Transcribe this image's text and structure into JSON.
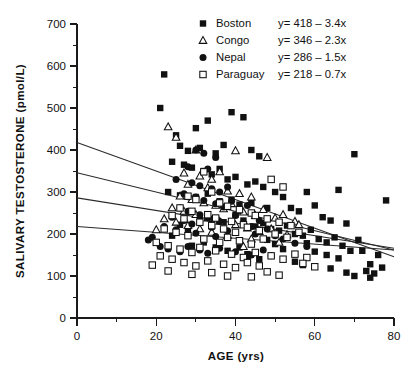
{
  "figure": {
    "background": "#ffffff",
    "ink_color": "#111111"
  },
  "chart_data": {
    "type": "scatter",
    "title": "",
    "xlabel": "AGE (yrs)",
    "ylabel": "SALIVARY TESTOSTERONE (pmol/L)",
    "xlim": [
      0,
      80
    ],
    "ylim": [
      0,
      700
    ],
    "xticks": [
      0,
      20,
      40,
      60,
      80
    ],
    "xtick_labels": [
      "0",
      "20",
      "40",
      "60",
      "80"
    ],
    "xminor_step": 10,
    "yticks": [
      0,
      100,
      200,
      300,
      400,
      500,
      600,
      700
    ],
    "ytick_labels": [
      "0",
      "100",
      "200",
      "300",
      "400",
      "500",
      "600",
      "700"
    ],
    "yminor_step": 50,
    "grid": false,
    "legend_position": "top-right",
    "series": [
      {
        "name": "Boston",
        "marker": "filled-square",
        "equation": "y= 418 – 3.4x",
        "fit": {
          "intercept": 418,
          "slope": -3.4,
          "x_start": 0,
          "x_end": 80
        },
        "points": [
          [
            22,
            580
          ],
          [
            21,
            500
          ],
          [
            25,
            435
          ],
          [
            30,
            452
          ],
          [
            33,
            470
          ],
          [
            39,
            490
          ],
          [
            42,
            478
          ],
          [
            26,
            410
          ],
          [
            28,
            398
          ],
          [
            31,
            405
          ],
          [
            35,
            392
          ],
          [
            37,
            412
          ],
          [
            44,
            400
          ],
          [
            46,
            385
          ],
          [
            24,
            372
          ],
          [
            27,
            365
          ],
          [
            29,
            358
          ],
          [
            32,
            350
          ],
          [
            34,
            342
          ],
          [
            36,
            355
          ],
          [
            38,
            330
          ],
          [
            40,
            336
          ],
          [
            43,
            318
          ],
          [
            45,
            325
          ],
          [
            47,
            312
          ],
          [
            23,
            300
          ],
          [
            26,
            292
          ],
          [
            30,
            288
          ],
          [
            33,
            296
          ],
          [
            36,
            278
          ],
          [
            39,
            282
          ],
          [
            41,
            270
          ],
          [
            44,
            274
          ],
          [
            48,
            262
          ],
          [
            50,
            300
          ],
          [
            52,
            288
          ],
          [
            54,
            262
          ],
          [
            56,
            254
          ],
          [
            58,
            300
          ],
          [
            60,
            268
          ],
          [
            62,
            240
          ],
          [
            64,
            232
          ],
          [
            66,
            305
          ],
          [
            68,
            225
          ],
          [
            70,
            390
          ],
          [
            72,
            160
          ],
          [
            74,
            128
          ],
          [
            76,
            150
          ],
          [
            78,
            280
          ],
          [
            31,
            242
          ],
          [
            34,
            236
          ],
          [
            37,
            228
          ],
          [
            40,
            246
          ],
          [
            42,
            232
          ],
          [
            45,
            218
          ],
          [
            47,
            226
          ],
          [
            49,
            212
          ],
          [
            51,
            208
          ],
          [
            53,
            220
          ],
          [
            55,
            200
          ],
          [
            57,
            196
          ],
          [
            59,
            210
          ],
          [
            61,
            188
          ],
          [
            63,
            180
          ],
          [
            65,
            192
          ],
          [
            67,
            172
          ],
          [
            69,
            160
          ],
          [
            71,
            186
          ],
          [
            73,
            112
          ],
          [
            75,
            106
          ],
          [
            77,
            120
          ],
          [
            58,
            178
          ],
          [
            60,
            158
          ],
          [
            63,
            150
          ],
          [
            66,
            142
          ],
          [
            50,
            176
          ],
          [
            52,
            164
          ],
          [
            48,
            186
          ],
          [
            28,
            210
          ],
          [
            26,
            222
          ],
          [
            24,
            196
          ],
          [
            43,
            152
          ],
          [
            46,
            140
          ],
          [
            41,
            168
          ],
          [
            35,
            168
          ],
          [
            38,
            160
          ],
          [
            32,
            180
          ],
          [
            29,
            172
          ],
          [
            55,
            134
          ],
          [
            57,
            126
          ],
          [
            64,
            118
          ],
          [
            68,
            108
          ],
          [
            70,
            100
          ],
          [
            74,
            96
          ]
        ]
      },
      {
        "name": "Congo",
        "marker": "open-triangle",
        "equation": "y= 346 – 2.3x",
        "fit": {
          "intercept": 346,
          "slope": -2.3,
          "x_start": 0,
          "x_end": 80
        },
        "points": [
          [
            23,
            455
          ],
          [
            25,
            430
          ],
          [
            30,
            400
          ],
          [
            40,
            398
          ],
          [
            48,
            382
          ],
          [
            27,
            345
          ],
          [
            31,
            338
          ],
          [
            34,
            330
          ],
          [
            36,
            348
          ],
          [
            28,
            318
          ],
          [
            33,
            310
          ],
          [
            38,
            302
          ],
          [
            41,
            296
          ],
          [
            44,
            288
          ],
          [
            26,
            290
          ],
          [
            29,
            282
          ],
          [
            32,
            274
          ],
          [
            35,
            268
          ],
          [
            37,
            260
          ],
          [
            39,
            272
          ],
          [
            42,
            252
          ],
          [
            45,
            244
          ],
          [
            47,
            258
          ],
          [
            50,
            238
          ],
          [
            52,
            246
          ],
          [
            55,
            230
          ],
          [
            24,
            262
          ],
          [
            27,
            254
          ],
          [
            30,
            246
          ],
          [
            33,
            238
          ],
          [
            36,
            230
          ],
          [
            40,
            222
          ],
          [
            43,
            214
          ],
          [
            46,
            206
          ],
          [
            49,
            212
          ],
          [
            53,
            198
          ],
          [
            56,
            222
          ],
          [
            22,
            236
          ],
          [
            25,
            228
          ],
          [
            28,
            220
          ],
          [
            31,
            212
          ],
          [
            34,
            204
          ],
          [
            38,
            196
          ],
          [
            44,
            188
          ],
          [
            51,
            180
          ],
          [
            20,
            210
          ],
          [
            42,
            170
          ]
        ]
      },
      {
        "name": "Nepal",
        "marker": "filled-circle",
        "equation": "y= 286 – 1.5x",
        "fit": {
          "intercept": 286,
          "slope": -1.5,
          "x_start": 0,
          "x_end": 80
        },
        "points": [
          [
            30,
            400
          ],
          [
            32,
            392
          ],
          [
            35,
            382
          ],
          [
            28,
            360
          ],
          [
            33,
            355
          ],
          [
            25,
            330
          ],
          [
            29,
            322
          ],
          [
            31,
            315
          ],
          [
            34,
            308
          ],
          [
            36,
            300
          ],
          [
            38,
            312
          ],
          [
            27,
            296
          ],
          [
            30,
            288
          ],
          [
            32,
            280
          ],
          [
            35,
            272
          ],
          [
            37,
            264
          ],
          [
            39,
            278
          ],
          [
            41,
            256
          ],
          [
            43,
            268
          ],
          [
            26,
            262
          ],
          [
            28,
            254
          ],
          [
            31,
            246
          ],
          [
            33,
            238
          ],
          [
            36,
            230
          ],
          [
            40,
            244
          ],
          [
            42,
            226
          ],
          [
            44,
            218
          ],
          [
            46,
            232
          ],
          [
            24,
            240
          ],
          [
            27,
            232
          ],
          [
            29,
            224
          ],
          [
            34,
            216
          ],
          [
            38,
            208
          ],
          [
            45,
            200
          ],
          [
            48,
            212
          ],
          [
            22,
            218
          ],
          [
            25,
            210
          ],
          [
            30,
            202
          ],
          [
            35,
            194
          ],
          [
            50,
            196
          ],
          [
            52,
            188
          ],
          [
            19,
            192
          ],
          [
            21,
            170
          ],
          [
            23,
            164
          ],
          [
            26,
            158
          ],
          [
            28,
            170
          ],
          [
            31,
            162
          ],
          [
            33,
            154
          ],
          [
            36,
            166
          ],
          [
            40,
            158
          ],
          [
            44,
            150
          ],
          [
            47,
            162
          ],
          [
            18,
            186
          ],
          [
            55,
            178
          ],
          [
            58,
            170
          ],
          [
            49,
            148
          ],
          [
            43,
            142
          ]
        ]
      },
      {
        "name": "Paraguay",
        "marker": "open-square",
        "equation": "y= 218 – 0.7x",
        "fit": {
          "intercept": 218,
          "slope": -0.7,
          "x_start": 0,
          "x_end": 80
        },
        "points": [
          [
            32,
            348
          ],
          [
            34,
            300
          ],
          [
            49,
            330
          ],
          [
            52,
            312
          ],
          [
            28,
            290
          ],
          [
            30,
            282
          ],
          [
            36,
            274
          ],
          [
            38,
            266
          ],
          [
            41,
            258
          ],
          [
            44,
            250
          ],
          [
            26,
            262
          ],
          [
            29,
            254
          ],
          [
            33,
            246
          ],
          [
            35,
            238
          ],
          [
            39,
            230
          ],
          [
            42,
            222
          ],
          [
            45,
            244
          ],
          [
            48,
            236
          ],
          [
            51,
            228
          ],
          [
            54,
            220
          ],
          [
            24,
            244
          ],
          [
            27,
            236
          ],
          [
            31,
            228
          ],
          [
            34,
            220
          ],
          [
            37,
            212
          ],
          [
            40,
            204
          ],
          [
            43,
            216
          ],
          [
            46,
            208
          ],
          [
            50,
            200
          ],
          [
            53,
            192
          ],
          [
            56,
            204
          ],
          [
            22,
            212
          ],
          [
            25,
            204
          ],
          [
            28,
            196
          ],
          [
            32,
            188
          ],
          [
            36,
            180
          ],
          [
            38,
            192
          ],
          [
            41,
            184
          ],
          [
            44,
            176
          ],
          [
            47,
            188
          ],
          [
            20,
            180
          ],
          [
            23,
            172
          ],
          [
            26,
            164
          ],
          [
            29,
            156
          ],
          [
            31,
            168
          ],
          [
            35,
            160
          ],
          [
            39,
            152
          ],
          [
            42,
            144
          ],
          [
            45,
            156
          ],
          [
            49,
            148
          ],
          [
            52,
            140
          ],
          [
            55,
            152
          ],
          [
            58,
            144
          ],
          [
            21,
            148
          ],
          [
            24,
            140
          ],
          [
            27,
            132
          ],
          [
            30,
            124
          ],
          [
            33,
            136
          ],
          [
            37,
            128
          ],
          [
            40,
            120
          ],
          [
            43,
            132
          ],
          [
            46,
            124
          ],
          [
            34,
            108
          ],
          [
            38,
            100
          ],
          [
            19,
            126
          ],
          [
            23,
            112
          ],
          [
            29,
            104
          ],
          [
            44,
            98
          ],
          [
            48,
            110
          ],
          [
            51,
            102
          ],
          [
            57,
            130
          ],
          [
            60,
            122
          ]
        ]
      }
    ]
  },
  "legend": {
    "rows": [
      {
        "label": "Boston",
        "equation": "y= 418 – 3.4x",
        "marker": "filled-square"
      },
      {
        "label": "Congo",
        "equation": "y= 346 – 2.3x",
        "marker": "open-triangle"
      },
      {
        "label": "Nepal",
        "equation": "y= 286 – 1.5x",
        "marker": "filled-circle"
      },
      {
        "label": "Paraguay",
        "equation": "y= 218 – 0.7x",
        "marker": "open-square"
      }
    ]
  }
}
